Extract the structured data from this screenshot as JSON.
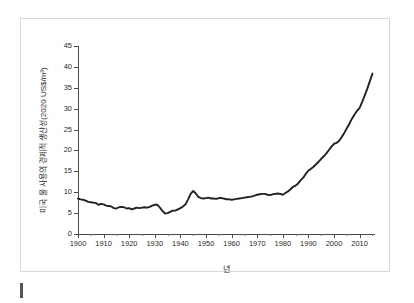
{
  "figure": {
    "frame_color": "#d8d8d8",
    "background": "#ffffff",
    "line_color": "#222222",
    "axis_color": "#4a4a4a"
  },
  "caret": {
    "name": "text-caret"
  },
  "chart_data": {
    "type": "line",
    "title": "",
    "subtitle": "",
    "xlabel": "년",
    "ylabel": "미국 물 사용의 경제적 생산성(2020 US$/m³)",
    "xlim": [
      1900,
      2016
    ],
    "ylim": [
      0,
      45
    ],
    "xticks": [
      1900,
      1910,
      1920,
      1930,
      1940,
      1950,
      1960,
      1970,
      1980,
      1990,
      2000,
      2010
    ],
    "xtick_labels": [
      "1900",
      "1910",
      "1920",
      "1930",
      "1940",
      "1950",
      "1960",
      "1970",
      "1980",
      "1990",
      "2000",
      "2010"
    ],
    "yticks": [
      0,
      5,
      10,
      15,
      20,
      25,
      30,
      35,
      40,
      45
    ],
    "ytick_labels": [
      "0",
      "5",
      "10",
      "15",
      "20",
      "25",
      "30",
      "35",
      "40",
      "45"
    ],
    "grid": false,
    "legend": null,
    "series": [
      {
        "name": "US economic water productivity",
        "color": "#222222",
        "x": [
          1900,
          1901,
          1902,
          1903,
          1904,
          1905,
          1906,
          1907,
          1908,
          1909,
          1910,
          1911,
          1912,
          1913,
          1914,
          1915,
          1916,
          1917,
          1918,
          1919,
          1920,
          1921,
          1922,
          1923,
          1924,
          1925,
          1926,
          1927,
          1928,
          1929,
          1930,
          1931,
          1932,
          1933,
          1934,
          1935,
          1936,
          1937,
          1938,
          1939,
          1940,
          1941,
          1942,
          1943,
          1944,
          1945,
          1946,
          1947,
          1948,
          1949,
          1950,
          1951,
          1952,
          1953,
          1954,
          1955,
          1956,
          1957,
          1958,
          1959,
          1960,
          1961,
          1962,
          1963,
          1964,
          1965,
          1966,
          1967,
          1968,
          1969,
          1970,
          1971,
          1972,
          1973,
          1974,
          1975,
          1976,
          1977,
          1978,
          1979,
          1980,
          1981,
          1982,
          1983,
          1984,
          1985,
          1986,
          1987,
          1988,
          1989,
          1990,
          1991,
          1992,
          1993,
          1994,
          1995,
          1996,
          1997,
          1998,
          1999,
          2000,
          2001,
          2002,
          2003,
          2004,
          2005,
          2006,
          2007,
          2008,
          2009,
          2010,
          2011,
          2012,
          2013,
          2014,
          2015
        ],
        "values": [
          8.5,
          8.3,
          8.2,
          8.0,
          7.7,
          7.6,
          7.5,
          7.4,
          7.0,
          7.2,
          7.1,
          6.8,
          6.7,
          6.6,
          6.2,
          6.1,
          6.4,
          6.5,
          6.4,
          6.1,
          6.2,
          5.9,
          6.1,
          6.3,
          6.2,
          6.3,
          6.4,
          6.3,
          6.5,
          6.8,
          7.0,
          7.0,
          6.3,
          5.5,
          4.9,
          5.0,
          5.3,
          5.6,
          5.6,
          5.9,
          6.2,
          6.6,
          7.1,
          8.3,
          9.6,
          10.3,
          9.7,
          8.9,
          8.6,
          8.5,
          8.6,
          8.7,
          8.5,
          8.5,
          8.4,
          8.6,
          8.6,
          8.5,
          8.3,
          8.3,
          8.2,
          8.3,
          8.4,
          8.5,
          8.6,
          8.7,
          8.8,
          8.9,
          9.0,
          9.2,
          9.4,
          9.5,
          9.6,
          9.6,
          9.4,
          9.3,
          9.5,
          9.6,
          9.7,
          9.6,
          9.4,
          9.8,
          10.2,
          10.7,
          11.3,
          11.6,
          12.1,
          12.9,
          13.5,
          14.4,
          15.2,
          15.6,
          16.1,
          16.7,
          17.3,
          18.0,
          18.6,
          19.3,
          20.1,
          20.9,
          21.6,
          21.8,
          22.3,
          23.2,
          24.2,
          25.3,
          26.4,
          27.6,
          28.6,
          29.5,
          30.2,
          31.6,
          33.2,
          34.8,
          36.6,
          38.4
        ]
      }
    ]
  }
}
